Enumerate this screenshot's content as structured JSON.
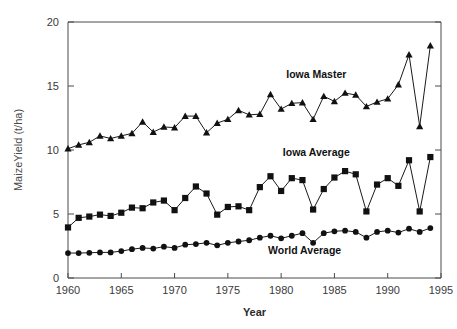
{
  "chart_data": {
    "type": "line",
    "title": "",
    "xlabel": "Year",
    "ylabel": "MaizeYield  (t/ha)",
    "xlim": [
      1960,
      1995
    ],
    "ylim": [
      0,
      20
    ],
    "xticks": [
      1960,
      1965,
      1970,
      1975,
      1980,
      1985,
      1990,
      1995
    ],
    "xtick_labels": [
      "1960",
      "1965",
      "1970",
      "1975",
      "1980",
      "1985",
      "1990",
      "1995"
    ],
    "yticks": [
      0,
      5,
      10,
      15,
      20
    ],
    "ytick_labels": [
      "0",
      "5",
      "10",
      "15",
      "20"
    ],
    "grid": false,
    "legend_position": "inline-annotations",
    "x": [
      1960,
      1961,
      1962,
      1963,
      1964,
      1965,
      1966,
      1967,
      1968,
      1969,
      1970,
      1971,
      1972,
      1973,
      1974,
      1975,
      1976,
      1977,
      1978,
      1979,
      1980,
      1981,
      1982,
      1983,
      1984,
      1985,
      1986,
      1987,
      1988,
      1989,
      1990,
      1991,
      1992,
      1993,
      1994
    ],
    "series": [
      {
        "name": "Iowa Master",
        "marker": "triangle",
        "color": "#111111",
        "label_x": 1983.3,
        "label_y": 15.6,
        "values": [
          10.1,
          10.4,
          10.6,
          11.1,
          10.9,
          11.1,
          11.3,
          12.2,
          11.4,
          11.8,
          11.75,
          12.65,
          12.65,
          11.35,
          12.1,
          12.4,
          13.1,
          12.75,
          12.8,
          14.35,
          13.2,
          13.65,
          13.7,
          12.4,
          14.2,
          13.8,
          14.45,
          14.3,
          13.4,
          13.75,
          14.0,
          15.1,
          17.45,
          11.85,
          18.15
        ]
      },
      {
        "name": "Iowa Average",
        "marker": "square",
        "color": "#111111",
        "label_x": 1983.3,
        "label_y": 9.55,
        "values": [
          3.95,
          4.7,
          4.8,
          4.95,
          4.85,
          5.1,
          5.5,
          5.45,
          5.9,
          6.05,
          5.3,
          6.25,
          7.15,
          6.6,
          4.95,
          5.55,
          5.6,
          5.3,
          7.1,
          7.95,
          6.8,
          7.8,
          7.65,
          5.35,
          6.95,
          7.85,
          8.35,
          8.1,
          5.2,
          7.3,
          7.8,
          7.2,
          9.2,
          5.2,
          9.45
        ]
      },
      {
        "name": "World Average",
        "marker": "circle",
        "color": "#111111",
        "label_x": 1982.2,
        "label_y": 1.9,
        "values": [
          1.95,
          1.95,
          1.97,
          2.0,
          2.0,
          2.1,
          2.25,
          2.35,
          2.3,
          2.45,
          2.35,
          2.6,
          2.65,
          2.75,
          2.55,
          2.75,
          2.85,
          2.95,
          3.15,
          3.3,
          3.1,
          3.3,
          3.5,
          2.75,
          3.5,
          3.65,
          3.7,
          3.6,
          3.15,
          3.6,
          3.7,
          3.55,
          3.85,
          3.6,
          3.9
        ]
      }
    ]
  }
}
